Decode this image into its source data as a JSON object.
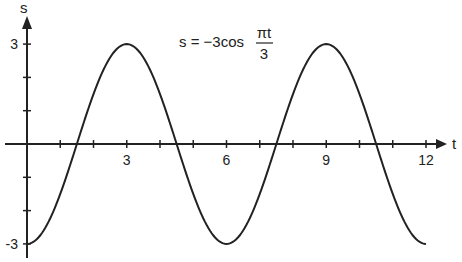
{
  "chart_data": {
    "type": "line",
    "title": "",
    "equation": {
      "lhs": "s = −3cos",
      "numerator": "πt",
      "denominator": "3"
    },
    "xlabel": "t",
    "ylabel": "s",
    "xlim": [
      0,
      12
    ],
    "ylim": [
      -3,
      3
    ],
    "x_ticks": [
      1,
      2,
      3,
      4,
      5,
      6,
      7,
      8,
      9,
      10,
      11,
      12
    ],
    "x_tick_labels": [
      {
        "value": 3,
        "label": "3"
      },
      {
        "value": 6,
        "label": "6"
      },
      {
        "value": 9,
        "label": "9"
      },
      {
        "value": 12,
        "label": "12"
      }
    ],
    "y_ticks": [
      -3,
      -2,
      -1,
      1,
      2,
      3
    ],
    "y_tick_labels": [
      {
        "value": 3,
        "label": "3"
      },
      {
        "value": -3,
        "label": "-3"
      }
    ],
    "grid": false,
    "legend": null,
    "series": [
      {
        "name": "s = -3cos(πt/3)",
        "function": "-3*cos(pi*t/3)",
        "x": [
          0,
          0.5,
          1,
          1.5,
          2,
          2.5,
          3,
          3.5,
          4,
          4.5,
          5,
          5.5,
          6,
          6.5,
          7,
          7.5,
          8,
          8.5,
          9,
          9.5,
          10,
          10.5,
          11,
          11.5,
          12
        ],
        "values": [
          -3,
          -2.6,
          -1.5,
          0,
          1.5,
          2.6,
          3,
          2.6,
          1.5,
          0,
          -1.5,
          -2.6,
          -3,
          -2.6,
          -1.5,
          0,
          1.5,
          2.6,
          3,
          2.6,
          1.5,
          0,
          -1.5,
          -2.6,
          -3
        ]
      }
    ]
  },
  "colors": {
    "line": "#222222",
    "axis": "#222222",
    "background": "#ffffff"
  }
}
